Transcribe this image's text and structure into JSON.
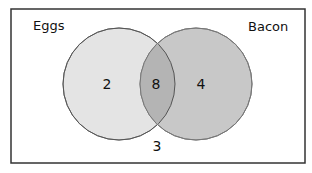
{
  "diagram": {
    "type": "venn",
    "sets": [
      {
        "name": "Eggs",
        "only_count": "2",
        "color": "#e4e4e4"
      },
      {
        "name": "Bacon",
        "only_count": "4",
        "color": "#c8c8c8"
      }
    ],
    "intersection_count": "8",
    "intersection_color": "#b4b4b4",
    "outside_count": "3"
  }
}
